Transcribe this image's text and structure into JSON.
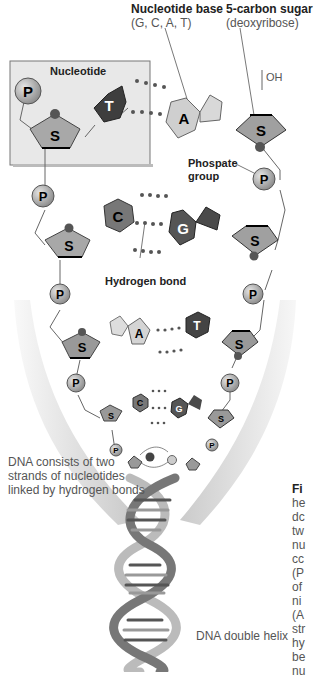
{
  "labels": {
    "nucleotide_base_title": "Nucleotide base",
    "nucleotide_base_sub": "(G, C, A, T)",
    "sugar_title": "5-carbon sugar",
    "sugar_sub": "(deoxyribose)",
    "nucleotide_box": "Nucleotide",
    "oh": "OH",
    "phosphate_group_1": "Phospate",
    "phosphate_group_2": "group",
    "hydrogen_bond": "Hydrogen bond",
    "strands_caption_1": "DNA consists of two",
    "strands_caption_2": "strands of nucleotides",
    "strands_caption_3": "linked by hydrogen bonds",
    "double_helix": "DNA double helix"
  },
  "figure_caption_fragments": [
    "Fi",
    "he",
    "dc",
    "tw",
    "nu",
    "cc",
    "(P",
    "of",
    "ni",
    "(A",
    "str",
    "hy",
    "be",
    "nu"
  ],
  "symbols": {
    "phosphate": "P",
    "sugar": "S",
    "thymine": "T",
    "adenine": "A",
    "cytosine": "C",
    "guanine": "G"
  },
  "colors": {
    "phosphate": "#a8a8a8",
    "sugar": "#9a9a9a",
    "thymine": "#4a4a4a",
    "adenine": "#d0d0d0",
    "cytosine": "#7a7a7a",
    "guanine": "#5a5a5a",
    "box": "#e8e8e8"
  }
}
